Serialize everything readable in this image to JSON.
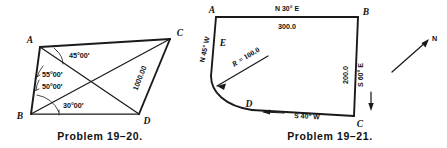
{
  "page": {
    "background": "#ffffff",
    "ink": "#1a1a1a",
    "width": 447,
    "height": 148
  },
  "figures": [
    {
      "id": "problem-19-20",
      "caption": "Problem 19–20.",
      "type": "quadrilateral-with-diagonals",
      "vertices": [
        {
          "key": "A",
          "label": "A",
          "x": 40,
          "y": 47
        },
        {
          "key": "B",
          "label": "B",
          "x": 31,
          "y": 114
        },
        {
          "key": "C",
          "label": "C",
          "x": 170,
          "y": 39
        },
        {
          "key": "D",
          "label": "D",
          "x": 139,
          "y": 114
        }
      ],
      "edges": [
        {
          "from": "A",
          "to": "C"
        },
        {
          "from": "A",
          "to": "B"
        },
        {
          "from": "B",
          "to": "D"
        },
        {
          "from": "D",
          "to": "C"
        }
      ],
      "diagonals": [
        {
          "from": "A",
          "to": "D"
        },
        {
          "from": "B",
          "to": "C"
        }
      ],
      "angles": [
        {
          "key": "angle-at-a",
          "value": "45°00′",
          "at": "A",
          "x": 69,
          "y": 58
        },
        {
          "key": "angle-b-upper",
          "value": "55°00′",
          "at": "B",
          "x": 44,
          "y": 76
        },
        {
          "key": "angle-b-middle",
          "value": "50°00′",
          "at": "B",
          "x": 44,
          "y": 88
        },
        {
          "key": "angle-b-lower",
          "value": "30°00′",
          "at": "B",
          "x": 64,
          "y": 107
        }
      ],
      "dimensions": [
        {
          "key": "cd-length",
          "value": "1000.00",
          "on": "C-D",
          "x": 142,
          "y": 79,
          "rotation": -68
        }
      ]
    },
    {
      "id": "problem-19-21",
      "caption": "Problem 19–21.",
      "type": "traverse-with-curve",
      "vertices": [
        {
          "key": "A",
          "label": "A",
          "x": 216,
          "y": 17
        },
        {
          "key": "B",
          "label": "B",
          "x": 358,
          "y": 17
        },
        {
          "key": "C",
          "label": "C",
          "x": 354,
          "y": 116
        },
        {
          "key": "D",
          "label": "D",
          "x": 252,
          "y": 110
        },
        {
          "key": "E",
          "label": "E",
          "x": 216,
          "y": 45
        }
      ],
      "courses": [
        {
          "key": "course-ab",
          "bearing": "N 30° E",
          "length": "300.0",
          "bearing_pos": {
            "x": 287,
            "y": 11
          },
          "length_pos": {
            "x": 287,
            "y": 29
          }
        },
        {
          "key": "course-bc",
          "bearing": "S 60° E",
          "length": "200.0",
          "bearing_pos": {
            "x": 372,
            "y": 75,
            "rotation": -90
          },
          "length_pos": {
            "x": 348,
            "y": 75,
            "rotation": -90
          }
        },
        {
          "key": "course-cd",
          "bearing": "S 40° W",
          "bearing_pos": {
            "x": 290,
            "y": 116,
            "rotation": 3
          }
        },
        {
          "key": "course-ea",
          "bearing": "N 45° W",
          "bearing_pos": {
            "x": 206,
            "y": 49,
            "rotation": -74
          }
        }
      ],
      "curve": {
        "key": "curve-radius",
        "radius_label": "R = 100.0",
        "radius_symbol": "R",
        "radius_value": "= 100.0",
        "label_pos": {
          "x": 247,
          "y": 60,
          "rotation": -33
        }
      },
      "north_arrow": {
        "key": "north-arrow",
        "label": "N",
        "label_pos": {
          "x": 432,
          "y": 41
        }
      }
    }
  ]
}
